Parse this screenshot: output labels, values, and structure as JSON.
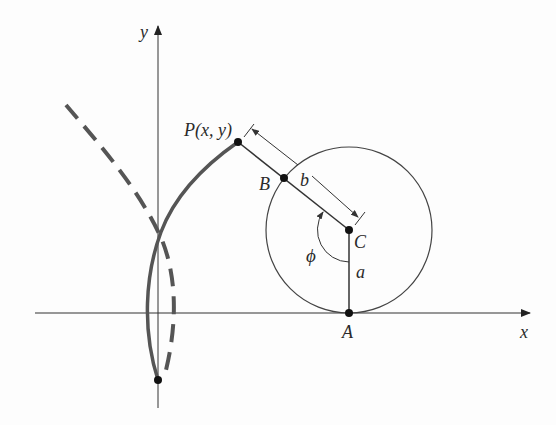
{
  "diagram": {
    "type": "geometric construction (trochoid / curve generated by point on rod attached to rolling circle)",
    "axes": {
      "x_label": "x",
      "y_label": "y"
    },
    "points": {
      "P": {
        "label": "P(x, y)",
        "x": 238,
        "y": 142
      },
      "B": {
        "label": "B",
        "x": 284,
        "y": 178
      },
      "C": {
        "label": "C",
        "x": 349,
        "y": 230
      },
      "A": {
        "label": "A",
        "x": 349,
        "y": 313
      },
      "bottom": {
        "label": "",
        "x": 158,
        "y": 380
      }
    },
    "segments": {
      "b": {
        "label": "b"
      },
      "a": {
        "label": "a"
      }
    },
    "angle": {
      "label": "ϕ"
    },
    "circle": {
      "cx": 349,
      "cy": 230,
      "r": 83
    },
    "colors": {
      "curve_solid": "#555555",
      "curve_dashed": "#555555",
      "lines": "#333333",
      "text": "#2a2a2a"
    }
  }
}
